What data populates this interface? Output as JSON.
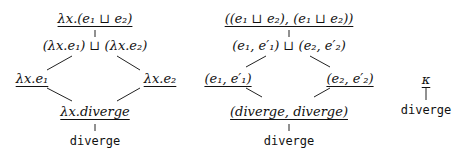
{
  "diagrams": [
    {
      "name": "lambda-lattice",
      "nodes": {
        "top": "λx.(e₁ ⊔ e₂)",
        "join": "(λx.e₁) ⊔ (λx.e₂)",
        "left": "λx.e₁",
        "right": "λx.e₂",
        "meet": "λx.diverge",
        "bottom": "diverge"
      }
    },
    {
      "name": "pair-lattice",
      "nodes": {
        "top": "((e₁ ⊔ e₂), (e₁ ⊔ e₂))",
        "join": "(e₁, e′₁) ⊔ (e₂, e′₂)",
        "left": "(e₁, e′₁)",
        "right": "(e₂, e′₂)",
        "meet": "(diverge, diverge)",
        "bottom": "diverge"
      }
    },
    {
      "name": "constant-lattice",
      "nodes": {
        "top": "κ",
        "bottom": "diverge"
      }
    }
  ]
}
